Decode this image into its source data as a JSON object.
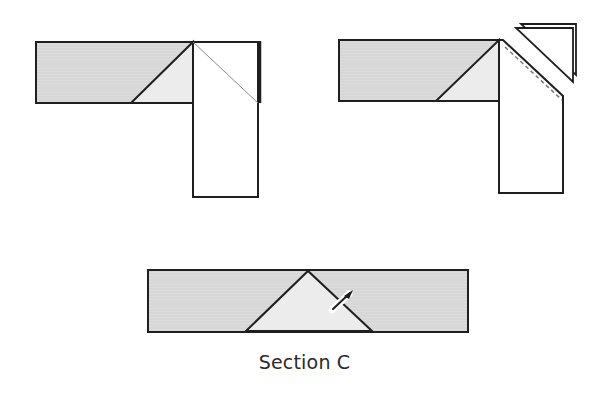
{
  "colors": {
    "stroke": "#1f1f1f",
    "shaded_fill": "#dedede",
    "light_fill": "#ececec",
    "white_fill": "#ffffff",
    "thin_line": "#8a8a8a"
  },
  "figures": [
    {
      "id": "figure-1",
      "description": "Strip joined at right angle, corner folded with diagonal line",
      "label": ""
    },
    {
      "id": "figure-2",
      "description": "Strip joined at right angle, corner triangle trimmed off along dashed seam line",
      "label": ""
    },
    {
      "id": "figure-3",
      "description": "Opened strip showing mitered triangle with seam ripper",
      "label": "Section C"
    }
  ],
  "caption": "Section C"
}
